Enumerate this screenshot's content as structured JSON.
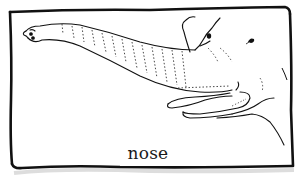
{
  "illustration": {
    "subject": "elephant-with-long-trunk",
    "caption": "nose",
    "colors": {
      "ink": "#111111",
      "paper": "#ffffff",
      "shadow": "#bdbdbd"
    }
  }
}
